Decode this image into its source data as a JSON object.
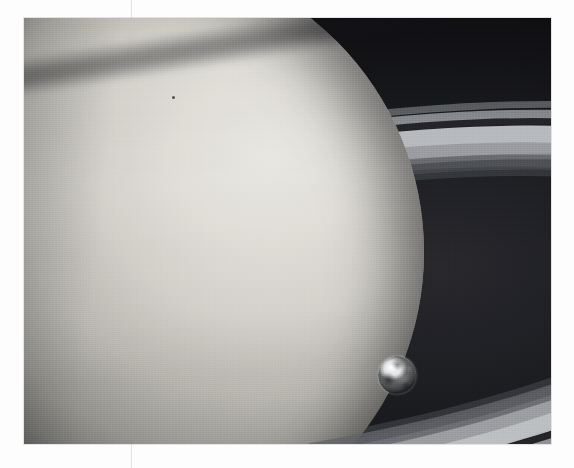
{
  "page": {
    "background_color": "#fdfdfd",
    "width": 574,
    "height": 468,
    "column_rule_color": "#e3e3e3",
    "column_rule_x": 131
  },
  "photo": {
    "alt_description": "Black-and-white spacecraft photograph of Saturn with its rings, shown alongside a much smaller image of Earth for scale",
    "frame": {
      "left": 24,
      "top": 18,
      "width": 527,
      "height": 426
    },
    "background_color": "#111114",
    "subjects": [
      {
        "name": "saturn",
        "label": "Saturn"
      },
      {
        "name": "rings",
        "label": "Saturn's rings"
      },
      {
        "name": "earth",
        "label": "Earth"
      }
    ]
  },
  "planet": {
    "name": "Saturn",
    "highlight_color": "#e6e5df",
    "midtone_color": "#b4b2ab",
    "shadow_color": "#2a2a2c",
    "terminator_side": "left",
    "band_count": 8,
    "features": [
      {
        "name": "ring-shadow",
        "label": "Ring shadow across northern latitudes"
      },
      {
        "name": "disc-spot",
        "label": "Small dark spot on disc"
      }
    ]
  },
  "rings": {
    "label": "Ring system",
    "tilt_degrees": -9.5,
    "bands": [
      {
        "name": "outer-faint-ring",
        "color": "#6d6f73",
        "width_px": 7,
        "opacity": 0.8
      },
      {
        "name": "a-ring",
        "color": "#8d9095",
        "width_px": 15,
        "opacity": 0.92
      },
      {
        "name": "cassini-division",
        "color": "#1d1e22",
        "width_px": 9,
        "opacity": 0.95
      },
      {
        "name": "b-ring",
        "color": "#b9bcbf",
        "width_px": 30,
        "opacity": 0.97
      },
      {
        "name": "b-c-transition",
        "color": "#8f9296",
        "width_px": 18,
        "opacity": 0.85
      },
      {
        "name": "c-ring",
        "color": "#5c5e63",
        "width_px": 16,
        "opacity": 0.75
      },
      {
        "name": "inner-faint-ring",
        "color": "#3b3d42",
        "width_px": 10,
        "opacity": 0.7
      }
    ],
    "streak": {
      "name": "bright-ring-streak",
      "label": "Thin bright streak crossing the far rings",
      "color": "#d6d9dd"
    }
  },
  "earth": {
    "name": "Earth",
    "label": "Earth (to scale)",
    "center": {
      "x": 373,
      "y": 357
    },
    "diameter_px": 38,
    "highlight_color": "#f3f4f4",
    "shadow_color": "#3f4143"
  }
}
